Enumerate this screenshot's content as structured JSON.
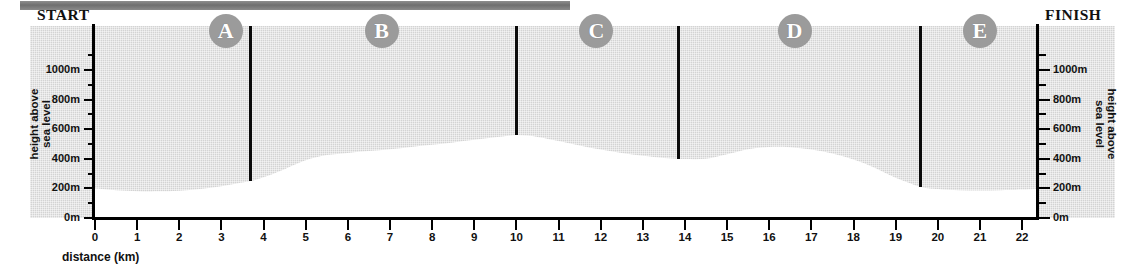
{
  "banner": {
    "name": "top-cropped-banner"
  },
  "labels": {
    "start": "START",
    "finish": "FINISH",
    "x_axis_title": "distance (km)",
    "y_axis_title_left": "height above\nsea level",
    "y_axis_title_right": "height above\nsea level"
  },
  "markers": [
    {
      "id": "A",
      "label": "A",
      "x_km": 3.1
    },
    {
      "id": "B",
      "label": "B",
      "x_km": 6.8
    },
    {
      "id": "C",
      "label": "C",
      "x_km": 11.9
    },
    {
      "id": "D",
      "label": "D",
      "x_km": 16.6
    },
    {
      "id": "E",
      "label": "E",
      "x_km": 21.0
    }
  ],
  "dividers": [
    {
      "x_km": 3.7,
      "top_height_m": 1200,
      "bottom_height_m": 250
    },
    {
      "x_km": 10.0,
      "top_height_m": 1200,
      "bottom_height_m": 560
    },
    {
      "x_km": 13.85,
      "top_height_m": 1200,
      "bottom_height_m": 400
    },
    {
      "x_km": 19.6,
      "top_height_m": 1200,
      "bottom_height_m": 210
    }
  ],
  "colors": {
    "sky": "#d3d3d3",
    "land": "#ffffff",
    "axis": "#000000",
    "marker_fill": "#9b9b9b",
    "marker_text": "#ffffff",
    "banner": "#7a7a7a"
  },
  "chart_data": {
    "type": "area",
    "title": "",
    "xlabel": "distance (km)",
    "ylabel": "height above sea level",
    "xlim": [
      0,
      22.35
    ],
    "ylim": [
      0,
      1200
    ],
    "grid": false,
    "legend": "none",
    "x_unit": "km",
    "y_unit": "m",
    "x_ticks": [
      0,
      1,
      2,
      3,
      4,
      5,
      6,
      7,
      8,
      9,
      10,
      11,
      12,
      13,
      14,
      15,
      16,
      17,
      18,
      19,
      20,
      21,
      22
    ],
    "y_ticks_major": [
      0,
      200,
      400,
      600,
      800,
      1000
    ],
    "y_ticks_minor": [
      100,
      300,
      500,
      700,
      900,
      1100
    ],
    "y_tick_labels": [
      "0m",
      "200m",
      "400m",
      "600m",
      "800m",
      "1000m"
    ],
    "series": [
      {
        "name": "ground profile",
        "x": [
          0,
          0.5,
          1,
          1.5,
          2,
          2.5,
          3,
          3.5,
          3.7,
          4,
          4.5,
          5,
          5.5,
          6,
          6.5,
          7,
          7.5,
          8,
          8.5,
          9,
          9.5,
          10,
          10.5,
          11,
          11.5,
          12,
          12.5,
          13,
          13.5,
          13.85,
          14,
          14.5,
          15,
          15.5,
          16,
          16.5,
          17,
          17.5,
          18,
          18.5,
          19,
          19.6,
          20,
          20.5,
          21,
          21.5,
          22,
          22.35
        ],
        "y": [
          200,
          188,
          181,
          180,
          184,
          196,
          215,
          240,
          250,
          275,
          330,
          390,
          425,
          440,
          452,
          465,
          480,
          495,
          510,
          528,
          545,
          560,
          548,
          520,
          490,
          462,
          440,
          420,
          406,
          400,
          398,
          400,
          430,
          465,
          480,
          478,
          462,
          435,
          395,
          340,
          272,
          210,
          196,
          188,
          186,
          188,
          192,
          196
        ]
      }
    ]
  }
}
